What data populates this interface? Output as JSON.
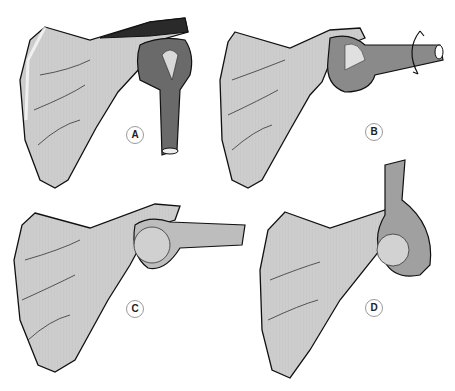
{
  "figure": {
    "colors": {
      "bone_fill": "#cfcfcf",
      "bone_highlight": "#ececec",
      "outline": "#111111",
      "shadow": "#3a3a3a",
      "background": "#ffffff"
    },
    "panels": [
      {
        "id": "A",
        "label": "A",
        "position": "top-left",
        "humerus_orientation": "down"
      },
      {
        "id": "B",
        "label": "B",
        "position": "top-right",
        "humerus_orientation": "lateral with rotation arrow"
      },
      {
        "id": "C",
        "label": "C",
        "position": "bottom-left",
        "humerus_orientation": "lateral abducted"
      },
      {
        "id": "D",
        "label": "D",
        "position": "bottom-right",
        "humerus_orientation": "up, elevated"
      }
    ]
  }
}
